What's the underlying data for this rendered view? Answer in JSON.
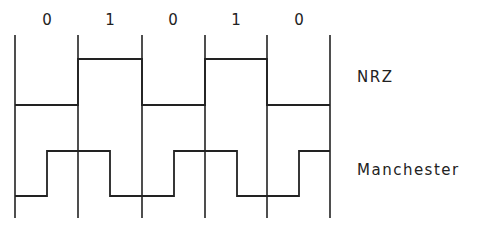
{
  "diagram": {
    "bits": [
      "0",
      "1",
      "0",
      "1",
      "0"
    ],
    "signals": [
      {
        "name": "NRZ",
        "label": "NRZ"
      },
      {
        "name": "Manchester",
        "label": "Manchester"
      }
    ],
    "colors": {
      "line": "#222222",
      "background": "#ffffff"
    }
  },
  "labels": {
    "bit_0": "0",
    "bit_1": "1",
    "bit_2": "0",
    "bit_3": "1",
    "bit_4": "0",
    "nrz": "NRZ",
    "manchester": "Manchester"
  }
}
